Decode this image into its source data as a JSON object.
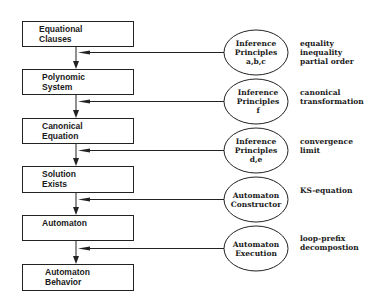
{
  "diagram": {
    "type": "flowchart",
    "boxes": [
      {
        "id": "equational-clauses",
        "lines": [
          "Equational",
          "Clauses"
        ]
      },
      {
        "id": "polynomic-system",
        "lines": [
          "Polynomic",
          "System"
        ]
      },
      {
        "id": "canonical-equation",
        "lines": [
          "Canonical",
          "Equation"
        ]
      },
      {
        "id": "solution-exists",
        "lines": [
          "Solution",
          "Exists"
        ]
      },
      {
        "id": "automaton",
        "lines": [
          "Automaton",
          ""
        ]
      },
      {
        "id": "automaton-behavior",
        "lines": [
          "Automaton",
          "Behavior"
        ]
      }
    ],
    "ellipses": [
      {
        "id": "inference-principles-abc",
        "lines": [
          "Inference",
          "Principles",
          "a,b,c"
        ]
      },
      {
        "id": "inference-principles-f",
        "lines": [
          "Inference",
          "Principles",
          "f"
        ]
      },
      {
        "id": "inference-principles-de",
        "lines": [
          "Inference",
          "Principles",
          "d,e"
        ]
      },
      {
        "id": "automaton-constructor",
        "lines": [
          "Automaton",
          "Constructor"
        ]
      },
      {
        "id": "automaton-execution",
        "lines": [
          "Automaton",
          "Execution"
        ]
      }
    ],
    "annotations": [
      {
        "lines": [
          "equality",
          "inequality",
          "partial order"
        ]
      },
      {
        "lines": [
          "canonical",
          "transformation"
        ]
      },
      {
        "lines": [
          "convergence",
          "limit"
        ]
      },
      {
        "lines": [
          "KS-equation"
        ]
      },
      {
        "lines": [
          "loop-prefix",
          "decompostion"
        ]
      }
    ],
    "edges": [
      {
        "from": "equational-clauses",
        "to": "polynomic-system",
        "input": "inference-principles-abc"
      },
      {
        "from": "polynomic-system",
        "to": "canonical-equation",
        "input": "inference-principles-f"
      },
      {
        "from": "canonical-equation",
        "to": "solution-exists",
        "input": "inference-principles-de"
      },
      {
        "from": "solution-exists",
        "to": "automaton",
        "input": "automaton-constructor"
      },
      {
        "from": "automaton",
        "to": "automaton-behavior",
        "input": "automaton-execution"
      }
    ],
    "colors": {
      "stroke": "#222222",
      "text": "#1a1a1a",
      "background": "#ffffff"
    }
  }
}
